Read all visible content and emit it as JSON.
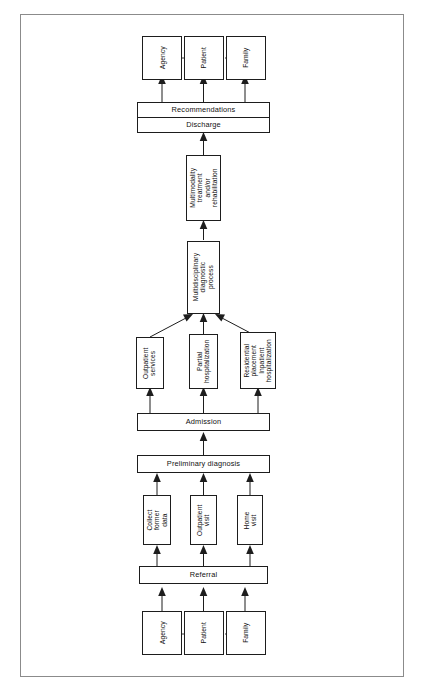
{
  "diagram": {
    "type": "flowchart",
    "orientation": "bottom-to-top",
    "nodes": {
      "out_agency": "Agency",
      "out_patient": "Patient",
      "out_family": "Family",
      "recommendations": "Recommendations",
      "discharge": "Discharge",
      "multimodality": "Multimodality treatment and/or rehabilitation",
      "multimodality_lines": "Multimodality | treatment | and/or | rehabilitation",
      "multidisciplinary": "Multidisciplinary diagnostic process",
      "multidisciplinary_lines": "Multidisciplinary | diagnostic | process",
      "outpatient_services": "Outpatient services",
      "outpatient_services_lines": "Outpatient | services",
      "partial_hospitalization": "Partial hospitalization",
      "partial_hospitalization_lines": "Partial | hospitalization",
      "residential": "Residential placement Inpatient hospitalization",
      "residential_lines": "Residential | placement | Inpatient | hospitalization",
      "admission": "Admission",
      "preliminary_diagnosis": "Preliminary diagnosis",
      "collect_former_data": "Collect former data",
      "collect_former_data_lines": "Collect | former | data",
      "outpatient_visit": "Outpatient visit",
      "outpatient_visit_lines": "Outpatient | visit",
      "home_visit": "Home visit",
      "home_visit_lines": "Home | visit",
      "referral": "Referral",
      "in_agency": "Agency",
      "in_patient": "Patient",
      "in_family": "Family"
    },
    "colors": {
      "ink": "#1d1d1d",
      "frame": "#8b8b8b",
      "paper": "#ffffff"
    }
  }
}
